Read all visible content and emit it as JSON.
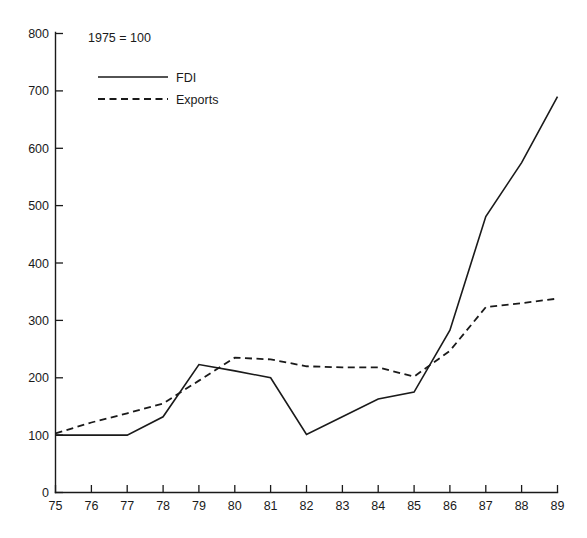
{
  "chart_data": {
    "type": "line",
    "title": "",
    "subtitle": "",
    "annotation": "1975 = 100",
    "xlabel": "",
    "ylabel": "",
    "x": [
      75,
      76,
      77,
      78,
      79,
      80,
      81,
      82,
      83,
      84,
      85,
      86,
      87,
      88,
      89
    ],
    "xtick_labels": [
      "75",
      "76",
      "77",
      "78",
      "79",
      "80",
      "81",
      "82",
      "83",
      "84",
      "85",
      "86",
      "87",
      "88",
      "89"
    ],
    "ytick_labels": [
      "0",
      "100",
      "200",
      "300",
      "400",
      "500",
      "600",
      "700",
      "800"
    ],
    "yticks": [
      0,
      100,
      200,
      300,
      400,
      500,
      600,
      700,
      800
    ],
    "xlim": [
      75,
      89
    ],
    "ylim": [
      0,
      800
    ],
    "grid": false,
    "legend_position": "top-left",
    "series": [
      {
        "name": "FDI",
        "style": "solid",
        "color": "#1a1a1a",
        "values": [
          100,
          100,
          100,
          132,
          223,
          212,
          200,
          101,
          132,
          163,
          175,
          283,
          481,
          575,
          690
        ]
      },
      {
        "name": "Exports",
        "style": "dashed",
        "color": "#1a1a1a",
        "values": [
          103,
          122,
          138,
          155,
          195,
          235,
          232,
          220,
          218,
          218,
          202,
          247,
          323,
          330,
          338
        ]
      }
    ]
  },
  "legend": {
    "items": [
      {
        "label": "FDI",
        "style": "solid"
      },
      {
        "label": "Exports",
        "style": "dashed"
      }
    ]
  },
  "axes": {
    "y_axis_name": "index-value-axis",
    "x_axis_name": "year-axis"
  }
}
